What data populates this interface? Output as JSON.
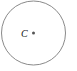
{
  "diagram": {
    "type": "geometry",
    "circle": {
      "cx": 33.5,
      "cy": 33,
      "r": 32,
      "stroke": "#8a8a8a",
      "fill": "#ffffff"
    },
    "center_point": {
      "x": 33.5,
      "y": 33,
      "r": 1.5,
      "color": "#555555",
      "label": "C",
      "label_x": 21,
      "label_y": 37
    }
  }
}
